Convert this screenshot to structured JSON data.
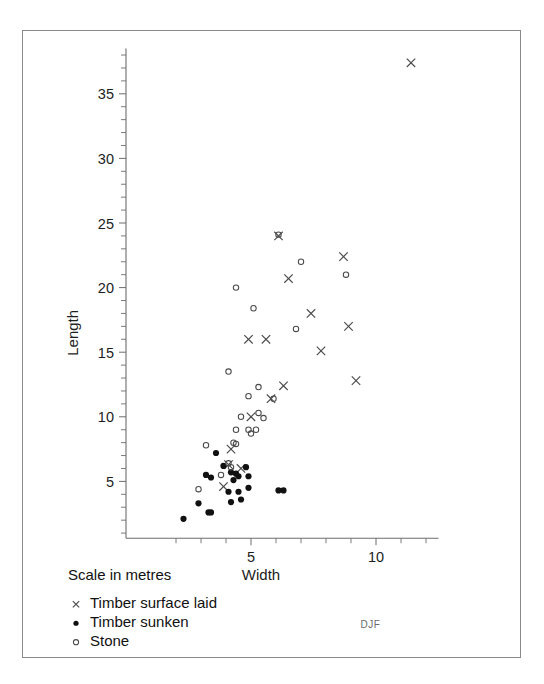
{
  "figure": {
    "signature": "DJF",
    "scale_note": "Scale in metres"
  },
  "legend": {
    "items": [
      {
        "marker": "cross-marker",
        "label": "Timber surface laid"
      },
      {
        "marker": "filled-circle-marker",
        "label": "Timber sunken"
      },
      {
        "marker": "open-circle-marker",
        "label": "Stone"
      }
    ]
  },
  "chart_data": {
    "type": "scatter",
    "title": "",
    "xlabel": "Width",
    "ylabel": "Length",
    "xlim": [
      1.2,
      12.5
    ],
    "ylim": [
      0.6,
      38.5
    ],
    "xticks": [
      5,
      10
    ],
    "yticks": [
      5,
      10,
      15,
      20,
      25,
      30,
      35
    ],
    "xtick_labels": [
      "5",
      "10"
    ],
    "ytick_labels": [
      "5",
      "10",
      "15",
      "20",
      "25",
      "30",
      "35"
    ],
    "x_minor_interval": 1,
    "y_minor_interval": 1,
    "grid": false,
    "legend_position": "below-axes-left",
    "units": "metres",
    "series": [
      {
        "name": "Timber surface laid",
        "marker": "x",
        "color": "#4a4a4a",
        "points": [
          [
            11.4,
            37.4
          ],
          [
            6.1,
            24.0
          ],
          [
            8.7,
            22.4
          ],
          [
            6.5,
            20.7
          ],
          [
            7.4,
            18.0
          ],
          [
            8.9,
            17.0
          ],
          [
            7.8,
            15.1
          ],
          [
            4.9,
            16.0
          ],
          [
            5.6,
            16.0
          ],
          [
            9.2,
            12.8
          ],
          [
            6.3,
            12.4
          ],
          [
            5.8,
            11.4
          ],
          [
            5.0,
            10.0
          ],
          [
            4.2,
            7.5
          ],
          [
            4.1,
            6.3
          ],
          [
            3.9,
            4.6
          ],
          [
            4.6,
            6.0
          ]
        ]
      },
      {
        "name": "Timber sunken",
        "marker": "filled-circle",
        "color": "#111111",
        "points": [
          [
            3.6,
            7.2
          ],
          [
            3.9,
            6.2
          ],
          [
            4.2,
            5.7
          ],
          [
            4.4,
            5.6
          ],
          [
            4.5,
            5.4
          ],
          [
            4.3,
            5.1
          ],
          [
            4.8,
            6.1
          ],
          [
            4.9,
            5.4
          ],
          [
            4.9,
            4.5
          ],
          [
            4.1,
            4.2
          ],
          [
            4.5,
            4.2
          ],
          [
            3.4,
            5.3
          ],
          [
            3.2,
            5.5
          ],
          [
            6.1,
            4.3
          ],
          [
            6.3,
            4.3
          ],
          [
            2.9,
            3.3
          ],
          [
            3.3,
            2.6
          ],
          [
            3.4,
            2.6
          ],
          [
            2.3,
            2.1
          ],
          [
            4.6,
            3.6
          ],
          [
            4.2,
            3.4
          ]
        ]
      },
      {
        "name": "Stone",
        "marker": "open-circle",
        "color": "#4a4a4a",
        "points": [
          [
            4.4,
            20.0
          ],
          [
            7.0,
            22.0
          ],
          [
            8.8,
            21.0
          ],
          [
            6.1,
            24.1
          ],
          [
            5.1,
            18.4
          ],
          [
            6.8,
            16.8
          ],
          [
            4.1,
            13.5
          ],
          [
            5.3,
            12.3
          ],
          [
            4.9,
            11.6
          ],
          [
            5.9,
            11.4
          ],
          [
            5.3,
            10.3
          ],
          [
            4.6,
            10.0
          ],
          [
            5.5,
            9.9
          ],
          [
            4.4,
            9.0
          ],
          [
            4.9,
            9.0
          ],
          [
            5.2,
            9.0
          ],
          [
            5.0,
            8.7
          ],
          [
            4.3,
            8.0
          ],
          [
            3.2,
            7.8
          ],
          [
            4.1,
            6.4
          ],
          [
            4.2,
            6.1
          ],
          [
            3.8,
            5.5
          ],
          [
            2.9,
            4.4
          ],
          [
            4.4,
            7.9
          ]
        ]
      }
    ]
  }
}
